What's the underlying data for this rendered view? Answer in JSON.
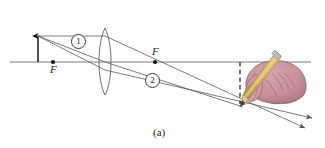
{
  "figure": {
    "caption": "(a)",
    "type": "converging-lens-ray-diagram",
    "labels": {
      "focal_point_left": "F",
      "focal_point_right": "F",
      "ray_one": "1",
      "ray_two": "2"
    },
    "colors": {
      "line": "#5a5a5a",
      "axis": "#6b6b6b",
      "lens_outline": "#6e6e6e",
      "object_arrow": "#1a1a1a",
      "dashed_image": "#2a2a2a",
      "hand_fill": "#c6919b",
      "hand_shadow": "#a9737f",
      "hand_outline": "#8e5f6a",
      "pencil_body": "#d8b46a",
      "pencil_shadow": "#b08f45",
      "pencil_tip_wood": "#e2c98f",
      "pencil_lead": "#3c3c3c",
      "pencil_ferrule": "#b9bcc0",
      "text": "#1b1b1b"
    },
    "geometry": {
      "axis_y": 62,
      "axis_x_start": 10,
      "axis_x_end": 311,
      "lens_center_x": 105,
      "lens_top_y": 28,
      "lens_bottom_y": 95,
      "object_x": 38,
      "object_top_y": 36,
      "focal_left_x": 71,
      "focal_right_x": 152,
      "image_x": 240,
      "image_bottom_y": 107
    }
  },
  "elements": {
    "optical_axis": "optical-axis",
    "lens": "converging-lens",
    "object": "object-arrow",
    "image": "image-arrow-dashed",
    "hand": "hand-holding-pencil",
    "pencil": "pencil"
  }
}
